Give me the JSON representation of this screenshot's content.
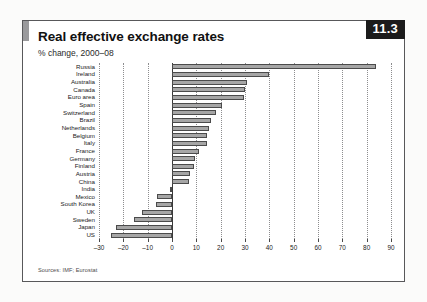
{
  "card": {
    "badge": "11.3",
    "title": "Real effective exchange rates",
    "subtitle": "% change, 2000–08",
    "source": "Sources: IMF; Eurostat"
  },
  "chart_data": {
    "type": "bar",
    "orientation": "horizontal",
    "title": "Real effective exchange rates",
    "subtitle": "% change, 2000–08",
    "xlabel": "",
    "ylabel": "",
    "xlim": [
      -30,
      90
    ],
    "xticks": [
      -30,
      -20,
      -10,
      0,
      10,
      20,
      30,
      40,
      50,
      60,
      70,
      80,
      90
    ],
    "xtick_labels": [
      "–30",
      "–20",
      "–10",
      "0",
      "10",
      "20",
      "30",
      "40",
      "50",
      "60",
      "70",
      "80",
      "90"
    ],
    "grid": "vertical-dotted",
    "legend": "none",
    "bar_fill": "#a6a6a6",
    "bar_stroke": "#4b4b4b",
    "categories": [
      "Russia",
      "Ireland",
      "Australia",
      "Canada",
      "Euro area",
      "Spain",
      "Switzerland",
      "Brazil",
      "Netherlands",
      "Belgium",
      "Italy",
      "France",
      "Germany",
      "Finland",
      "Austria",
      "China",
      "India",
      "Mexico",
      "South Korea",
      "UK",
      "Sweden",
      "Japan",
      "US"
    ],
    "values": [
      84,
      40,
      31,
      30,
      29.5,
      20.5,
      18,
      16,
      15,
      14.5,
      14.5,
      11,
      9.5,
      9,
      7.5,
      7,
      -1,
      -6,
      -6.5,
      -12.5,
      -15.5,
      -23,
      -25
    ]
  }
}
